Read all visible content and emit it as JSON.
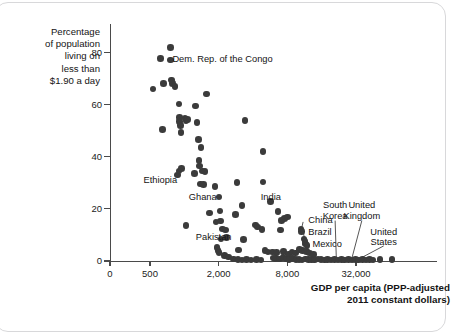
{
  "figure": {
    "y_axis_title": "Percentage\nof population\nliving on\nless than\n$1.90 a day",
    "x_axis_title": "GDP per capita (PPP-adjusted\n2011 constant dollars)"
  },
  "chart_data": {
    "type": "scatter",
    "title": "",
    "xlabel": "GDP per capita (PPP-adjusted 2011 constant dollars)",
    "ylabel": "Percentage of population living on less than $1.90 a day",
    "xscale": "log",
    "yscale": "linear",
    "xlim": [
      380,
      75000
    ],
    "ylim": [
      0,
      88
    ],
    "grid": false,
    "legend": null,
    "xticks": [
      {
        "label": "0",
        "value": 0
      },
      {
        "label": "500",
        "value": 500
      },
      {
        "label": "2,000",
        "value": 2000
      },
      {
        "label": "8,000",
        "value": 8000
      },
      {
        "label": "32,000",
        "value": 32000
      }
    ],
    "yticks": [
      {
        "label": "0",
        "value": 0
      },
      {
        "label": "20",
        "value": 20
      },
      {
        "label": "40",
        "value": 40
      },
      {
        "label": "60",
        "value": 60
      },
      {
        "label": "80",
        "value": 80
      }
    ],
    "annotations": [
      {
        "text": "Dem. Rep. of the Congo",
        "x": 740,
        "y": 77.5,
        "align": "left"
      },
      {
        "text": "Ethiopia",
        "x": 900,
        "y": 31.0,
        "align": "right"
      },
      {
        "text": "Ghana",
        "x": 2000,
        "y": 24.5,
        "align": "right"
      },
      {
        "text": "India",
        "x": 4400,
        "y": 24.5,
        "align": "left"
      },
      {
        "text": "Pakistan",
        "x": 2700,
        "y": 9.0,
        "align": "right"
      },
      {
        "text": "China",
        "x": 11500,
        "y": 15.5,
        "align": "left"
      },
      {
        "text": "Brazil",
        "x": 11500,
        "y": 11.0,
        "align": "left"
      },
      {
        "text": "Mexico",
        "x": 12500,
        "y": 6.5,
        "align": "left"
      },
      {
        "text": "South\nKorea",
        "x": 21000,
        "y": 19.0,
        "align": "center"
      },
      {
        "text": "United\nKingdom",
        "x": 36000,
        "y": 19.0,
        "align": "center"
      },
      {
        "text": "United\nStates",
        "x": 56000,
        "y": 9.0,
        "align": "center"
      }
    ],
    "points": [
      {
        "x": 530,
        "y": 66.0
      },
      {
        "x": 620,
        "y": 77.6
      },
      {
        "x": 660,
        "y": 68.2
      },
      {
        "x": 640,
        "y": 50.4
      },
      {
        "x": 755,
        "y": 82.0
      },
      {
        "x": 760,
        "y": 77.2
      },
      {
        "x": 770,
        "y": 69.5
      },
      {
        "x": 790,
        "y": 68.0
      },
      {
        "x": 830,
        "y": 67.0
      },
      {
        "x": 900,
        "y": 60.3
      },
      {
        "x": 905,
        "y": 55.0
      },
      {
        "x": 910,
        "y": 53.5
      },
      {
        "x": 930,
        "y": 52.0
      },
      {
        "x": 935,
        "y": 49.3
      },
      {
        "x": 1010,
        "y": 54.8
      },
      {
        "x": 1030,
        "y": 53.9
      },
      {
        "x": 1060,
        "y": 54.2
      },
      {
        "x": 1250,
        "y": 59.5
      },
      {
        "x": 1290,
        "y": 53.2
      },
      {
        "x": 1560,
        "y": 64.0
      },
      {
        "x": 1330,
        "y": 46.6
      },
      {
        "x": 1400,
        "y": 43.5
      },
      {
        "x": 1340,
        "y": 38.5
      },
      {
        "x": 1360,
        "y": 36.5
      },
      {
        "x": 3400,
        "y": 53.8
      },
      {
        "x": 4900,
        "y": 42.0
      },
      {
        "x": 870,
        "y": 33.0
      },
      {
        "x": 900,
        "y": 34.5
      },
      {
        "x": 940,
        "y": 35.4
      },
      {
        "x": 1230,
        "y": 33.5
      },
      {
        "x": 1440,
        "y": 34.5
      },
      {
        "x": 1520,
        "y": 34.3
      },
      {
        "x": 1390,
        "y": 29.6
      },
      {
        "x": 1470,
        "y": 29.4
      },
      {
        "x": 1850,
        "y": 28.6
      },
      {
        "x": 2900,
        "y": 30.2
      },
      {
        "x": 4900,
        "y": 30.3
      },
      {
        "x": 2010,
        "y": 24.6
      },
      {
        "x": 5700,
        "y": 22.8
      },
      {
        "x": 3200,
        "y": 21.4
      },
      {
        "x": 6600,
        "y": 19.0
      },
      {
        "x": 1660,
        "y": 18.4
      },
      {
        "x": 2050,
        "y": 19.2
      },
      {
        "x": 2800,
        "y": 17.9
      },
      {
        "x": 8000,
        "y": 16.9
      },
      {
        "x": 7600,
        "y": 16.3
      },
      {
        "x": 7100,
        "y": 15.6
      },
      {
        "x": 1030,
        "y": 13.7
      },
      {
        "x": 1900,
        "y": 15.0
      },
      {
        "x": 2080,
        "y": 15.3
      },
      {
        "x": 4200,
        "y": 13.8
      },
      {
        "x": 4400,
        "y": 13.1
      },
      {
        "x": 2150,
        "y": 12.3
      },
      {
        "x": 2300,
        "y": 11.9
      },
      {
        "x": 4800,
        "y": 12.1
      },
      {
        "x": 7000,
        "y": 11.9
      },
      {
        "x": 10500,
        "y": 12.3
      },
      {
        "x": 10700,
        "y": 11.4
      },
      {
        "x": 2100,
        "y": 8.5
      },
      {
        "x": 2350,
        "y": 9.0
      },
      {
        "x": 3300,
        "y": 8.3
      },
      {
        "x": 11200,
        "y": 8.5
      },
      {
        "x": 11400,
        "y": 7.5
      },
      {
        "x": 11600,
        "y": 6.6
      },
      {
        "x": 11900,
        "y": 6.0
      },
      {
        "x": 1940,
        "y": 5.2
      },
      {
        "x": 1980,
        "y": 4.0
      },
      {
        "x": 2020,
        "y": 3.3
      },
      {
        "x": 3000,
        "y": 4.2
      },
      {
        "x": 5100,
        "y": 4.0
      },
      {
        "x": 5400,
        "y": 3.5
      },
      {
        "x": 5900,
        "y": 3.4
      },
      {
        "x": 6400,
        "y": 3.2
      },
      {
        "x": 7400,
        "y": 3.7
      },
      {
        "x": 8200,
        "y": 2.6
      },
      {
        "x": 8800,
        "y": 3.4
      },
      {
        "x": 9400,
        "y": 3.1
      },
      {
        "x": 10200,
        "y": 4.4
      },
      {
        "x": 10900,
        "y": 4.0
      },
      {
        "x": 11800,
        "y": 3.6
      },
      {
        "x": 12500,
        "y": 3.0
      },
      {
        "x": 13500,
        "y": 2.5
      },
      {
        "x": 2250,
        "y": 2.0
      },
      {
        "x": 2450,
        "y": 1.6
      },
      {
        "x": 2700,
        "y": 0.7
      },
      {
        "x": 2950,
        "y": 0.5
      },
      {
        "x": 3200,
        "y": 0.4
      },
      {
        "x": 3500,
        "y": 0.5
      },
      {
        "x": 3850,
        "y": 0.4
      },
      {
        "x": 4300,
        "y": 0.6
      },
      {
        "x": 4700,
        "y": 0.4
      },
      {
        "x": 6000,
        "y": 1.2
      },
      {
        "x": 6300,
        "y": 0.9
      },
      {
        "x": 6800,
        "y": 0.8
      },
      {
        "x": 7300,
        "y": 1.4
      },
      {
        "x": 7800,
        "y": 0.7
      },
      {
        "x": 8300,
        "y": 0.6
      },
      {
        "x": 8900,
        "y": 0.9
      },
      {
        "x": 9500,
        "y": 0.5
      },
      {
        "x": 10100,
        "y": 0.6
      },
      {
        "x": 10800,
        "y": 0.4
      },
      {
        "x": 11500,
        "y": 0.8
      },
      {
        "x": 12200,
        "y": 0.5
      },
      {
        "x": 13000,
        "y": 0.6
      },
      {
        "x": 13900,
        "y": 0.4
      },
      {
        "x": 14800,
        "y": 0.7
      },
      {
        "x": 15800,
        "y": 0.5
      },
      {
        "x": 16900,
        "y": 0.4
      },
      {
        "x": 18000,
        "y": 0.6
      },
      {
        "x": 19300,
        "y": 0.4
      },
      {
        "x": 20700,
        "y": 0.5
      },
      {
        "x": 22200,
        "y": 0.4
      },
      {
        "x": 23800,
        "y": 0.6
      },
      {
        "x": 25500,
        "y": 0.4
      },
      {
        "x": 27400,
        "y": 0.5
      },
      {
        "x": 29400,
        "y": 0.4
      },
      {
        "x": 31500,
        "y": 0.5
      },
      {
        "x": 33800,
        "y": 0.4
      },
      {
        "x": 36300,
        "y": 0.5
      },
      {
        "x": 39000,
        "y": 0.4
      },
      {
        "x": 41900,
        "y": 0.5
      },
      {
        "x": 45000,
        "y": 0.4
      },
      {
        "x": 52000,
        "y": 0.5
      },
      {
        "x": 66000,
        "y": 0.5
      }
    ],
    "point_color": "#3b3b3b"
  }
}
